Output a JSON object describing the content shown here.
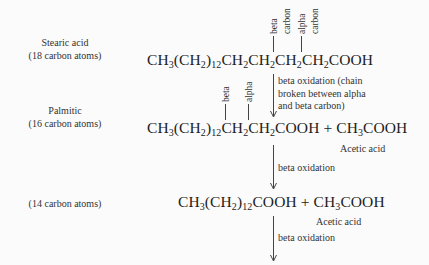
{
  "steps": [
    {
      "name_line1": "Stearic acid",
      "name_line2": "(18 carbon atoms)",
      "formula": {
        "a": "CH",
        "s1": "3",
        "b": "(CH",
        "s2": "2",
        "c": ")",
        "s3": "12",
        "d": "CH",
        "s4": "2",
        "e": "CH",
        "s5": "2",
        "f": "CH",
        "s6": "2",
        "g": "CH",
        "s7": "2",
        "h": "COOH"
      },
      "labels": {
        "beta": "beta",
        "beta_carbon": "carbon",
        "alpha": "alpha",
        "alpha_carbon": "carbon"
      }
    },
    {
      "name_line1": "Palmitic",
      "name_line2": "(16 carbon atoms)",
      "formula": {
        "a": "CH",
        "s1": "3",
        "b": "(CH",
        "s2": "2",
        "c": ")",
        "s3": "12",
        "d": "CH",
        "s4": "2",
        "e": "CH",
        "s5": "2",
        "h": "COOH",
        "plus": " + ",
        "p1": "CH",
        "ps1": "3",
        "p2": "COOH"
      },
      "labels": {
        "beta": "beta",
        "alpha": "alpha"
      },
      "byproduct": "Acetic acid"
    },
    {
      "name_line2": "(14 carbon atoms)",
      "formula": {
        "a": "CH",
        "s1": "3",
        "b": "(CH",
        "s2": "2",
        "c": ")",
        "s3": "12",
        "h": "COOH",
        "plus": " + ",
        "p1": "CH",
        "ps1": "3",
        "p2": "COOH"
      },
      "byproduct": "Acetic acid"
    }
  ],
  "arrows": [
    {
      "lines": [
        "beta oxidation (chain",
        "broken between alpha",
        "and beta carbon)"
      ]
    },
    {
      "lines": [
        "beta oxidation"
      ]
    },
    {
      "lines": [
        "beta oxidation"
      ]
    }
  ]
}
